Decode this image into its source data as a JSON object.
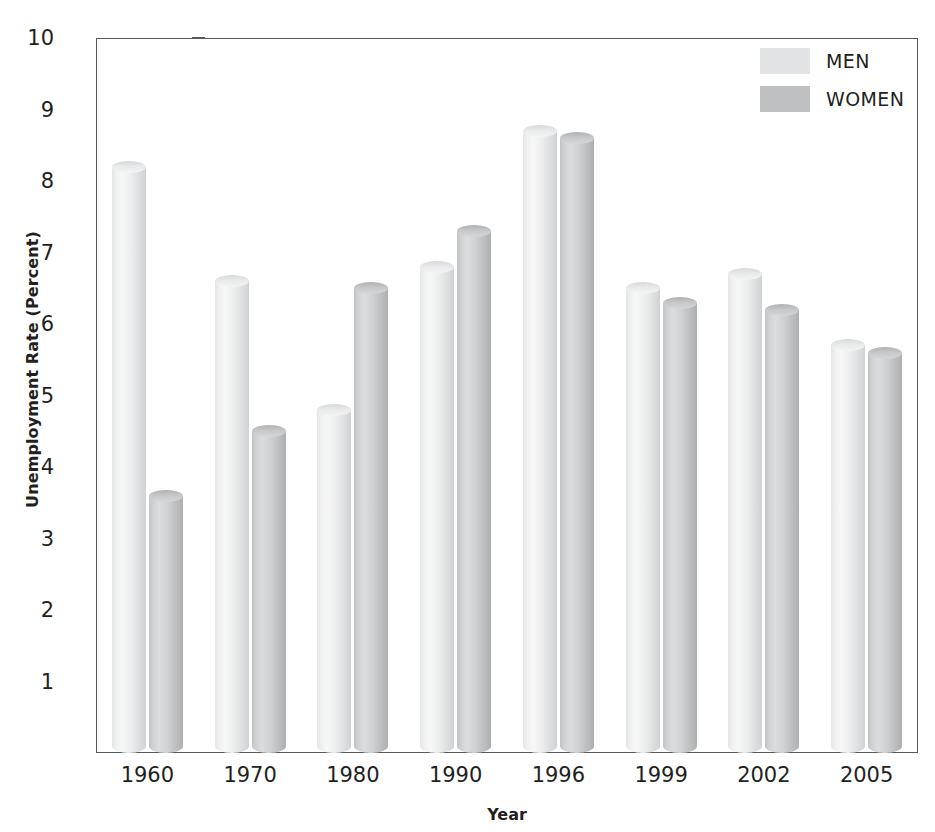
{
  "chart_data": {
    "type": "bar",
    "title": "",
    "subtitle": "",
    "xlabel": "Year",
    "ylabel": "Unemployment Rate (Percent)",
    "categories": [
      "1960",
      "1970",
      "1980",
      "1990",
      "1996",
      "1999",
      "2002",
      "2005"
    ],
    "series": [
      {
        "name": "MEN",
        "color": "#e2e3e4",
        "values": [
          8.2,
          6.6,
          4.8,
          6.8,
          8.7,
          6.5,
          6.7,
          5.7
        ]
      },
      {
        "name": "WOMEN",
        "color": "#bfc0c2",
        "values": [
          3.6,
          4.5,
          6.5,
          7.3,
          8.6,
          6.3,
          6.2,
          5.6
        ]
      }
    ],
    "ylim": [
      0,
      10
    ],
    "y_ticks": [
      "1",
      "2",
      "3",
      "4",
      "5",
      "6",
      "7",
      "8",
      "9",
      "10"
    ],
    "grid": false,
    "legend_position": "top-right"
  },
  "axes": {
    "y_title": "Unemployment Rate (Percent)",
    "x_title": "Year"
  },
  "legend": {
    "entries": [
      {
        "label": "MEN",
        "swatch": "men-swatch"
      },
      {
        "label": "WOMEN",
        "swatch": "women-swatch"
      }
    ]
  }
}
